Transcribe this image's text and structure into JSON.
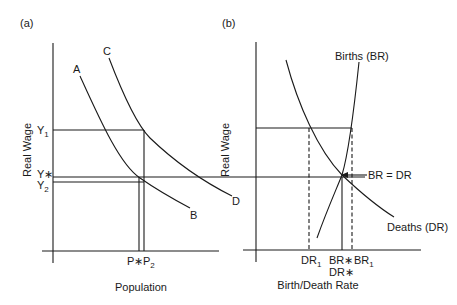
{
  "panel_a": {
    "tag": "(a)",
    "ylabel": "Real Wage",
    "xlabel": "Population",
    "curves": [
      {
        "start_label": "A",
        "end_label": "B"
      },
      {
        "start_label": "C",
        "end_label": "D"
      }
    ],
    "y_ticks": {
      "y1": "Y",
      "y1_sub": "1",
      "ystar": "Y∗",
      "y2": "Y",
      "y2_sub": "2"
    },
    "x_ticks": {
      "pstar": "P∗",
      "p2": "P",
      "p2_sub": "2"
    }
  },
  "panel_b": {
    "tag": "(b)",
    "ylabel": "Real Wage",
    "xlabel": "Birth/Death Rate",
    "births_label": "Births (BR)",
    "deaths_label": "Deaths (DR)",
    "equilibrium_label": "BR = DR",
    "x_ticks": {
      "dr1": "DR",
      "dr1_sub": "1",
      "brstar": "BR∗",
      "drstar": "DR∗",
      "br1": "BR",
      "br1_sub": "1"
    }
  }
}
